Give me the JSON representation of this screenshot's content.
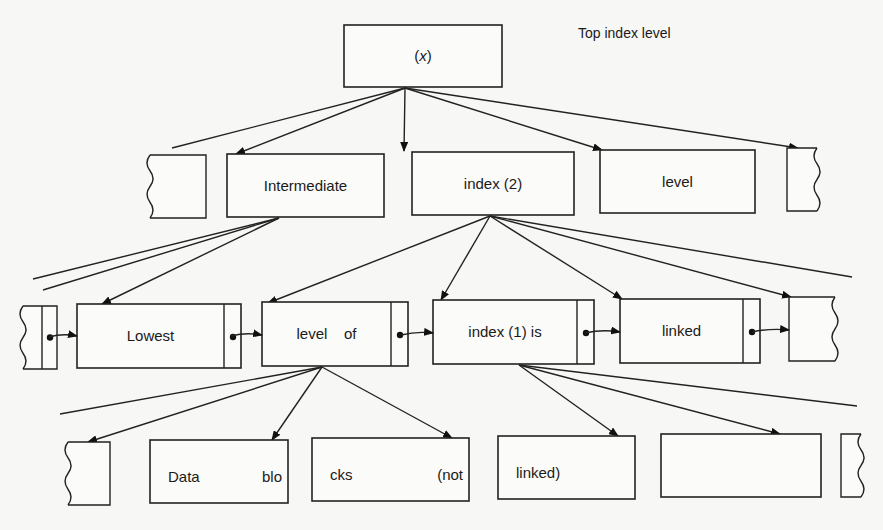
{
  "diagram": {
    "title_annotation": "Top index level",
    "levels": {
      "top": {
        "name": "top-index-level",
        "nodes": [
          {
            "id": "root",
            "label": "(x)",
            "x": 344,
            "y": 25,
            "w": 158,
            "h": 62
          }
        ]
      },
      "intermediate": {
        "name": "intermediate-index-level",
        "nodes": [
          {
            "id": "int-partial-left",
            "label": "",
            "x": 150,
            "y": 155,
            "w": 56,
            "h": 63,
            "partial": "left"
          },
          {
            "id": "int-1",
            "label": "Intermediate",
            "x": 227,
            "y": 154,
            "w": 157,
            "h": 63
          },
          {
            "id": "int-2",
            "label": "index (2)",
            "x": 412,
            "y": 152,
            "w": 162,
            "h": 63
          },
          {
            "id": "int-3",
            "label": "level",
            "x": 600,
            "y": 150,
            "w": 155,
            "h": 63
          },
          {
            "id": "int-partial-right",
            "label": "",
            "x": 787,
            "y": 148,
            "w": 30,
            "h": 63,
            "partial": "right"
          }
        ]
      },
      "lowest": {
        "name": "lowest-index-level",
        "nodes": [
          {
            "id": "low-partial-left",
            "label": "",
            "x": 23,
            "y": 306,
            "w": 34,
            "h": 63,
            "partial": "left",
            "pointer_cell": true
          },
          {
            "id": "low-1",
            "label": "Lowest",
            "x": 77,
            "y": 304,
            "w": 164,
            "h": 64,
            "pointer_cell": true
          },
          {
            "id": "low-2",
            "label": "level    of",
            "x": 262,
            "y": 302,
            "w": 146,
            "h": 64,
            "pointer_cell": true
          },
          {
            "id": "low-3",
            "label": "index (1) is",
            "x": 433,
            "y": 300,
            "w": 161,
            "h": 64,
            "pointer_cell": true
          },
          {
            "id": "low-4",
            "label": "linked",
            "x": 620,
            "y": 299,
            "w": 140,
            "h": 64,
            "pointer_cell": true
          },
          {
            "id": "low-partial-right",
            "label": "",
            "x": 789,
            "y": 297,
            "w": 46,
            "h": 64,
            "partial": "right"
          }
        ]
      },
      "data": {
        "name": "data-blocks-level",
        "nodes": [
          {
            "id": "data-partial-left",
            "label": "",
            "x": 68,
            "y": 442,
            "w": 42,
            "h": 63,
            "partial": "left"
          },
          {
            "id": "data-1",
            "label_left": "Data",
            "label_right": "blo",
            "x": 150,
            "y": 440,
            "w": 138,
            "h": 63
          },
          {
            "id": "data-2",
            "label_left": "cks",
            "label_right": "(not",
            "x": 312,
            "y": 438,
            "w": 157,
            "h": 63
          },
          {
            "id": "data-3",
            "label_left": "linked)",
            "label_right": "",
            "x": 498,
            "y": 436,
            "w": 137,
            "h": 63
          },
          {
            "id": "data-4",
            "label_left": "",
            "label_right": "",
            "x": 661,
            "y": 434,
            "w": 160,
            "h": 63
          },
          {
            "id": "data-partial-right",
            "label": "",
            "x": 841,
            "y": 434,
            "w": 20,
            "h": 63,
            "partial": "right"
          }
        ]
      }
    },
    "edges": [
      {
        "from": [
          405,
          88
        ],
        "to": [
          172,
          148
        ],
        "arrow": false
      },
      {
        "from": [
          405,
          88
        ],
        "to": [
          236,
          154
        ],
        "arrow": true
      },
      {
        "from": [
          405,
          88
        ],
        "to": [
          404,
          151
        ],
        "arrow": true
      },
      {
        "from": [
          405,
          88
        ],
        "to": [
          602,
          150
        ],
        "arrow": true
      },
      {
        "from": [
          405,
          88
        ],
        "to": [
          798,
          148
        ],
        "arrow": true
      },
      {
        "from": [
          279,
          218
        ],
        "to": [
          33,
          279
        ],
        "arrow": false
      },
      {
        "from": [
          279,
          218
        ],
        "to": [
          43,
          290
        ],
        "arrow": false
      },
      {
        "from": [
          279,
          218
        ],
        "to": [
          102,
          304
        ],
        "arrow": true
      },
      {
        "from": [
          490,
          216
        ],
        "to": [
          268,
          303
        ],
        "arrow": true
      },
      {
        "from": [
          490,
          216
        ],
        "to": [
          441,
          300
        ],
        "arrow": true
      },
      {
        "from": [
          490,
          216
        ],
        "to": [
          622,
          299
        ],
        "arrow": true
      },
      {
        "from": [
          490,
          216
        ],
        "to": [
          791,
          297
        ],
        "arrow": true
      },
      {
        "from": [
          490,
          216
        ],
        "to": [
          852,
          277
        ],
        "arrow": false
      },
      {
        "from": [
          322,
          367
        ],
        "to": [
          60,
          414
        ],
        "arrow": false
      },
      {
        "from": [
          322,
          367
        ],
        "to": [
          88,
          442
        ],
        "arrow": true
      },
      {
        "from": [
          322,
          367
        ],
        "to": [
          272,
          440
        ],
        "arrow": true
      },
      {
        "from": [
          322,
          367
        ],
        "to": [
          452,
          438
        ],
        "arrow": true
      },
      {
        "from": [
          519,
          365
        ],
        "to": [
          618,
          436
        ],
        "arrow": true
      },
      {
        "from": [
          519,
          365
        ],
        "to": [
          780,
          434
        ],
        "arrow": true
      },
      {
        "from": [
          519,
          365
        ],
        "to": [
          857,
          406
        ],
        "arrow": false
      }
    ],
    "links": [
      {
        "from": [
          49,
          337
        ],
        "to": [
          77,
          336
        ]
      },
      {
        "from": [
          231,
          336
        ],
        "to": [
          262,
          335
        ]
      },
      {
        "from": [
          401,
          335
        ],
        "to": [
          433,
          333
        ]
      },
      {
        "from": [
          585,
          333
        ],
        "to": [
          620,
          332
        ]
      },
      {
        "from": [
          752,
          332
        ],
        "to": [
          789,
          330
        ]
      }
    ],
    "colors": {
      "ink": "#222222",
      "paper": "#f7f7f5",
      "box_fill": "#fbfbf9"
    }
  }
}
